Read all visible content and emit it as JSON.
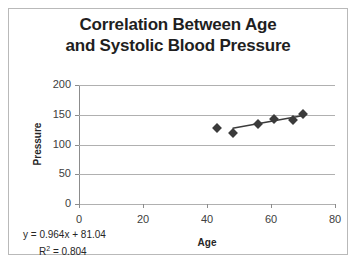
{
  "chart_data": {
    "type": "scatter",
    "title": "Correlation Between Age and Systolic Blood Pressure",
    "title_line1": "Correlation Between Age",
    "title_line2": "and Systolic Blood Pressure",
    "xlabel": "Age",
    "ylabel": "Pressure",
    "xlim": [
      0,
      80
    ],
    "ylim": [
      0,
      200
    ],
    "xticks": [
      0,
      20,
      40,
      60,
      80
    ],
    "yticks": [
      0,
      50,
      100,
      150,
      200
    ],
    "xtick_labels": [
      "0",
      "20",
      "40",
      "60",
      "80"
    ],
    "ytick_labels": [
      "0",
      "50",
      "100",
      "150",
      "200"
    ],
    "grid": true,
    "grid_axis": "y",
    "legend": false,
    "series": [
      {
        "name": "Blood Pressure vs Age",
        "marker": "diamond",
        "marker_color": "#3b3b3b",
        "points": [
          {
            "x": 43,
            "y": 127
          },
          {
            "x": 48,
            "y": 119
          },
          {
            "x": 56,
            "y": 135
          },
          {
            "x": 61,
            "y": 143
          },
          {
            "x": 67,
            "y": 141
          },
          {
            "x": 70,
            "y": 152
          }
        ]
      }
    ],
    "trendline": {
      "type": "linear",
      "slope": 0.964,
      "intercept": 81.04,
      "r_squared": 0.804,
      "equation_text": "y = 0.964x + 81.04",
      "r2_text_prefix": "R",
      "r2_text_sup": "2",
      "r2_text_suffix": " = 0.804",
      "color": "#3b3b3b",
      "x_start": 48,
      "x_end": 71
    },
    "colors": {
      "gridline": "#b0b0b0",
      "axis": "#8c8c8c",
      "border": "#b9b9b9",
      "title_text": "#1f1f1f",
      "tick_text": "#404040",
      "background": "#ffffff"
    }
  }
}
